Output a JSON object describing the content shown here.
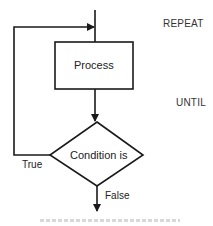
{
  "diagram": {
    "type": "flowchart",
    "nodes": [
      {
        "id": "process",
        "shape": "rectangle",
        "label": "Process"
      },
      {
        "id": "condition",
        "shape": "diamond",
        "label": "Condition is"
      }
    ],
    "edges": [
      {
        "from": "entry",
        "to": "process"
      },
      {
        "from": "process",
        "to": "condition"
      },
      {
        "from": "condition",
        "to": "process",
        "label": "True"
      },
      {
        "from": "condition",
        "to": "exit",
        "label": "False"
      }
    ],
    "side_labels": {
      "repeat": "REPEAT",
      "until": "UNTIL"
    },
    "branch_labels": {
      "true": "True",
      "false": "False"
    },
    "colors": {
      "stroke": "#1a1a1a",
      "background": "#ffffff"
    }
  }
}
